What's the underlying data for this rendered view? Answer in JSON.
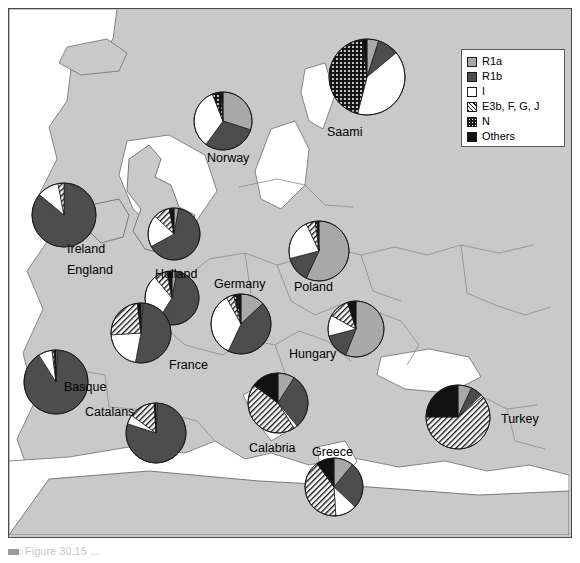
{
  "figure": {
    "type": "map-with-pie-charts",
    "background_color": "#c9c9c9",
    "land_color": "#c9c9c9",
    "sea_color": "#ffffff"
  },
  "legend": {
    "position": "top-right",
    "items": [
      {
        "key": "R1a",
        "label": "R1a",
        "swatch": "sw-r1a",
        "color": "#a8a8a8"
      },
      {
        "key": "R1b",
        "label": "R1b",
        "swatch": "sw-r1b",
        "color": "#4d4d4d"
      },
      {
        "key": "I",
        "label": "I",
        "swatch": "sw-i",
        "color": "#ffffff"
      },
      {
        "key": "E3b_F_G_J",
        "label": "E3b, F, G, J",
        "swatch": "sw-e3b",
        "color": "#ffffff"
      },
      {
        "key": "N",
        "label": "N",
        "swatch": "sw-n",
        "color": "#1a1a1a"
      },
      {
        "key": "Others",
        "label": "Others",
        "swatch": "sw-others",
        "color": "#111111"
      }
    ]
  },
  "chart_data": {
    "type": "pie",
    "categories": [
      "R1a",
      "R1b",
      "I",
      "E3b, F, G, J",
      "N",
      "Others"
    ],
    "units": "percent",
    "series": [
      {
        "name": "Saami",
        "label": "Saami",
        "label_x": 318,
        "label_y": 117,
        "cx": 358,
        "cy": 68,
        "r": 38,
        "start_angle": -90,
        "values": [
          5,
          9,
          40,
          0,
          44,
          2
        ]
      },
      {
        "name": "Norway",
        "label": "Norway",
        "label_x": 198,
        "label_y": 143,
        "cx": 214,
        "cy": 112,
        "r": 29,
        "start_angle": -90,
        "values": [
          30,
          30,
          34,
          0,
          5,
          1
        ]
      },
      {
        "name": "Ireland",
        "label": "Ireland",
        "label_x": 58,
        "label_y": 234,
        "cx": 55,
        "cy": 206,
        "r": 32,
        "start_angle": -90,
        "values": [
          0,
          86,
          11,
          3,
          0,
          0
        ]
      },
      {
        "name": "England",
        "label": "England",
        "label_x": 58,
        "label_y": 255,
        "cx": 165,
        "cy": 225,
        "r": 26,
        "start_angle": -90,
        "values": [
          3,
          64,
          20,
          10,
          0,
          3
        ]
      },
      {
        "name": "Holland",
        "label": "Holland",
        "label_x": 146,
        "label_y": 259,
        "cx": 163,
        "cy": 289,
        "r": 27,
        "start_angle": -90,
        "values": [
          3,
          56,
          30,
          8,
          0,
          3
        ]
      },
      {
        "name": "Germany",
        "label": "Germany",
        "label_x": 205,
        "label_y": 269,
        "cx": 232,
        "cy": 315,
        "r": 30,
        "start_angle": -90,
        "values": [
          13,
          44,
          35,
          4,
          2,
          2
        ]
      },
      {
        "name": "Poland",
        "label": "Poland",
        "label_x": 285,
        "label_y": 272,
        "cx": 310,
        "cy": 242,
        "r": 30,
        "start_angle": -90,
        "values": [
          57,
          14,
          22,
          5,
          1,
          1
        ]
      },
      {
        "name": "France",
        "label": "France",
        "label_x": 160,
        "label_y": 350,
        "cx": 132,
        "cy": 324,
        "r": 30,
        "start_angle": -90,
        "values": [
          1,
          52,
          21,
          24,
          0,
          2
        ]
      },
      {
        "name": "Basque",
        "label": "Basque",
        "label_x": 55,
        "label_y": 372,
        "cx": 47,
        "cy": 373,
        "r": 32,
        "start_angle": -90,
        "values": [
          1,
          90,
          7,
          1,
          0,
          1
        ]
      },
      {
        "name": "Catalans",
        "label": "Catalans",
        "label_x": 76,
        "label_y": 397,
        "cx": 147,
        "cy": 424,
        "r": 30,
        "start_angle": -90,
        "values": [
          1,
          79,
          5,
          14,
          0,
          1
        ]
      },
      {
        "name": "Hungary",
        "label": "Hungary",
        "label_x": 280,
        "label_y": 339,
        "cx": 347,
        "cy": 320,
        "r": 28,
        "start_angle": -90,
        "values": [
          56,
          15,
          12,
          12,
          0,
          5
        ]
      },
      {
        "name": "Calabria",
        "label": "Calabria",
        "label_x": 240,
        "label_y": 433,
        "cx": 269,
        "cy": 394,
        "r": 30,
        "start_angle": -90,
        "values": [
          9,
          30,
          2,
          44,
          0,
          15
        ]
      },
      {
        "name": "Greece",
        "label": "Greece",
        "label_x": 303,
        "label_y": 437,
        "cx": 325,
        "cy": 478,
        "r": 29,
        "start_angle": -90,
        "values": [
          11,
          26,
          12,
          41,
          0,
          10
        ]
      },
      {
        "name": "Turkey",
        "label": "Turkey",
        "label_x": 492,
        "label_y": 404,
        "cx": 449,
        "cy": 408,
        "r": 32,
        "start_angle": -90,
        "values": [
          7,
          6,
          1,
          61,
          0,
          25
        ]
      }
    ]
  },
  "caption": {
    "partial_text": "Figure 30.15 ..."
  }
}
